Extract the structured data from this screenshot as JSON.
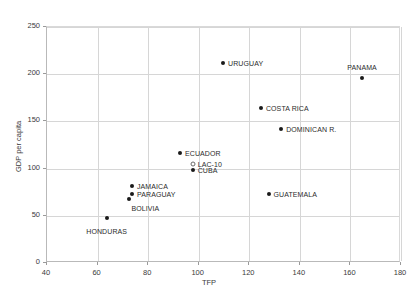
{
  "chart_data": {
    "type": "scatter",
    "title": "",
    "xlabel": "TFP",
    "ylabel": "GDP per capita",
    "xlim": [
      40,
      180
    ],
    "ylim": [
      0,
      250
    ],
    "xticks": [
      40,
      60,
      80,
      100,
      120,
      140,
      160,
      180
    ],
    "yticks": [
      0,
      50,
      100,
      150,
      200,
      250
    ],
    "grid": true,
    "legend": "none",
    "points": [
      {
        "label": "HONDURAS",
        "x": 64,
        "y": 47,
        "marker": "filled",
        "label_pos": "below"
      },
      {
        "label": "BOLIVIA",
        "x": 73,
        "y": 67,
        "marker": "filled",
        "label_pos": "below-right"
      },
      {
        "label": "PARAGUAY",
        "x": 74,
        "y": 72,
        "marker": "filled",
        "label_pos": "right"
      },
      {
        "label": "JAMAICA",
        "x": 74,
        "y": 81,
        "marker": "filled",
        "label_pos": "right"
      },
      {
        "label": "CUBA",
        "x": 98,
        "y": 97,
        "marker": "filled",
        "label_pos": "right"
      },
      {
        "label": "LAC-10",
        "x": 98,
        "y": 104,
        "marker": "open",
        "label_pos": "right"
      },
      {
        "label": "ECUADOR",
        "x": 93,
        "y": 115,
        "marker": "filled",
        "label_pos": "right"
      },
      {
        "label": "GUATEMALA",
        "x": 128,
        "y": 72,
        "marker": "filled",
        "label_pos": "right"
      },
      {
        "label": "DOMINICAN R.",
        "x": 133,
        "y": 141,
        "marker": "filled",
        "label_pos": "right"
      },
      {
        "label": "COSTA RICA",
        "x": 125,
        "y": 163,
        "marker": "filled",
        "label_pos": "right"
      },
      {
        "label": "URUGUAY",
        "x": 110,
        "y": 211,
        "marker": "filled",
        "label_pos": "right"
      },
      {
        "label": "PANAMA",
        "x": 165,
        "y": 195,
        "marker": "filled",
        "label_pos": "above"
      }
    ]
  },
  "axes": {
    "x_title": "TFP",
    "y_title": "GDP per capita",
    "x_tick_labels": [
      "40",
      "60",
      "80",
      "100",
      "120",
      "140",
      "160",
      "180"
    ],
    "y_tick_labels": [
      "0",
      "50",
      "100",
      "150",
      "200",
      "250"
    ]
  },
  "colors": {
    "marker": "#1a1a1a",
    "marker_open_border": "#6b6b6b",
    "grid": "#d6d6d6",
    "axis": "#b9b9b9",
    "text": "#2b2b2b",
    "background": "#ffffff"
  }
}
